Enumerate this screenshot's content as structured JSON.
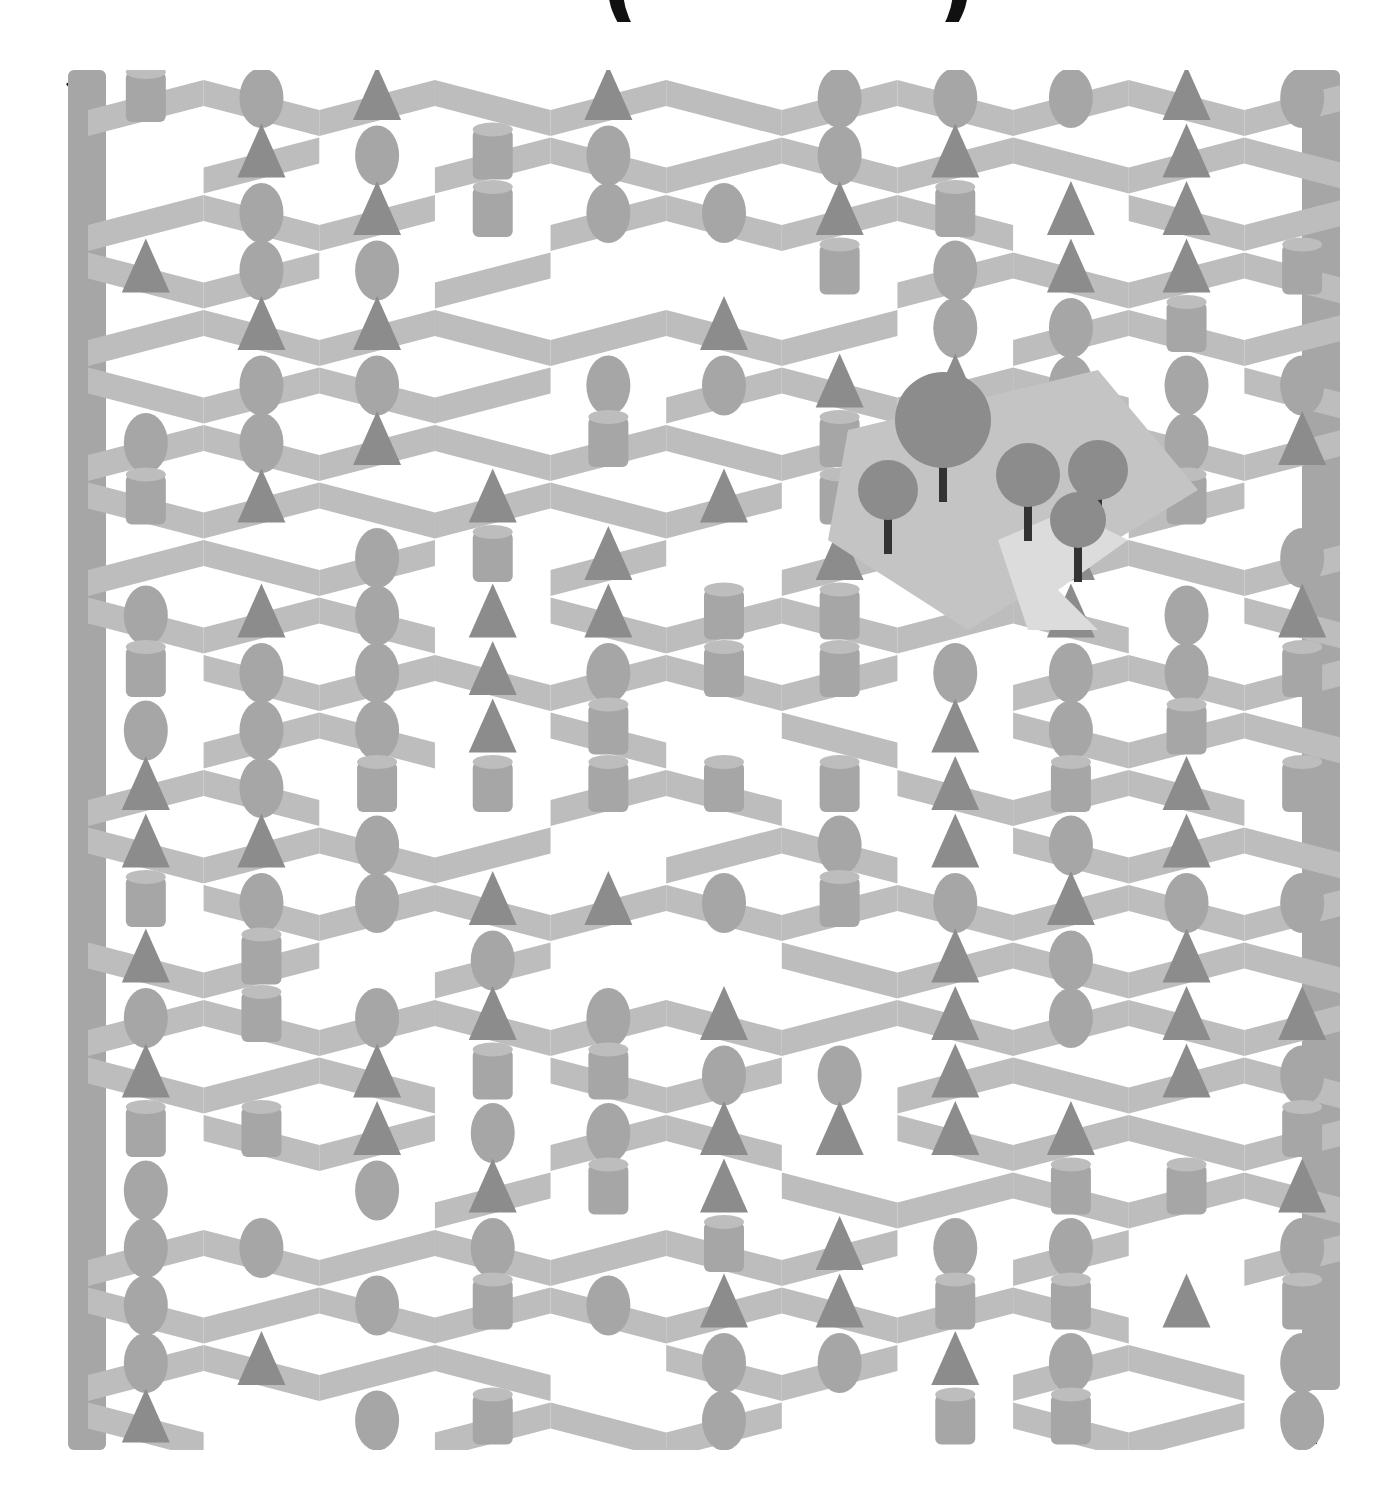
{
  "puzzle": {
    "type": "isometric maze",
    "title_fragment_left": "(",
    "title_fragment_right": ")",
    "start_marker": "start-arrow",
    "end_marker": "finish-arrow",
    "center_feature": "forest clearing with trees and path",
    "colors": {
      "background": "#ffffff",
      "wall": "#a6a6a6",
      "wall_dark": "#8c8c8c",
      "wall_light": "#bdbdbd",
      "arrow": "#111111",
      "clearing": "#c4c4c4",
      "path": "#dcdcdc",
      "trunk": "#333333"
    }
  }
}
